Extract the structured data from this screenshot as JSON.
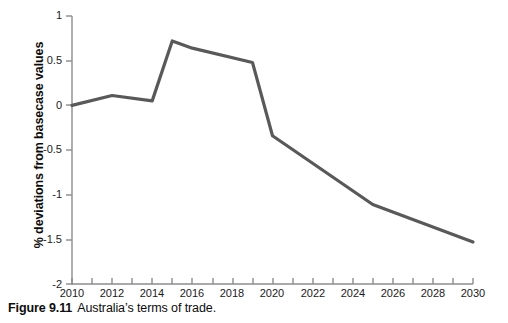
{
  "caption": {
    "label": "Figure 9.11",
    "text": "Australia’s terms of trade."
  },
  "chart_data": {
    "type": "line",
    "title": "",
    "subtitle": "",
    "xlabel": "",
    "ylabel": "% deviations from basecase values",
    "xlim": [
      2010,
      2030
    ],
    "ylim": [
      -2,
      1
    ],
    "grid": false,
    "legend": false,
    "legend_position": "none",
    "line_color": "#595959",
    "axis_color": "#808080",
    "x_ticks": [
      2010,
      2011,
      2012,
      2013,
      2014,
      2015,
      2016,
      2017,
      2018,
      2019,
      2020,
      2021,
      2022,
      2023,
      2024,
      2025,
      2026,
      2027,
      2028,
      2029,
      2030
    ],
    "x_tick_labels": [
      "2010",
      "",
      "2012",
      "",
      "2014",
      "",
      "2016",
      "",
      "2018",
      "",
      "2020",
      "",
      "2022",
      "",
      "2024",
      "",
      "2026",
      "",
      "2028",
      "",
      "2030"
    ],
    "y_ticks": [
      1,
      0.5,
      0,
      -0.5,
      -1,
      -1.5,
      -2
    ],
    "y_tick_labels": [
      "1",
      "0.5",
      "0",
      "-0.5",
      "-1",
      "-1.5",
      "-2"
    ],
    "series": [
      {
        "name": "Australia's terms of trade",
        "x": [
          2010,
          2012,
          2014,
          2015,
          2016,
          2019,
          2020,
          2025,
          2030
        ],
        "values": [
          0.0,
          0.11,
          0.05,
          0.72,
          0.64,
          0.48,
          -0.34,
          -1.11,
          -1.53
        ]
      }
    ]
  }
}
